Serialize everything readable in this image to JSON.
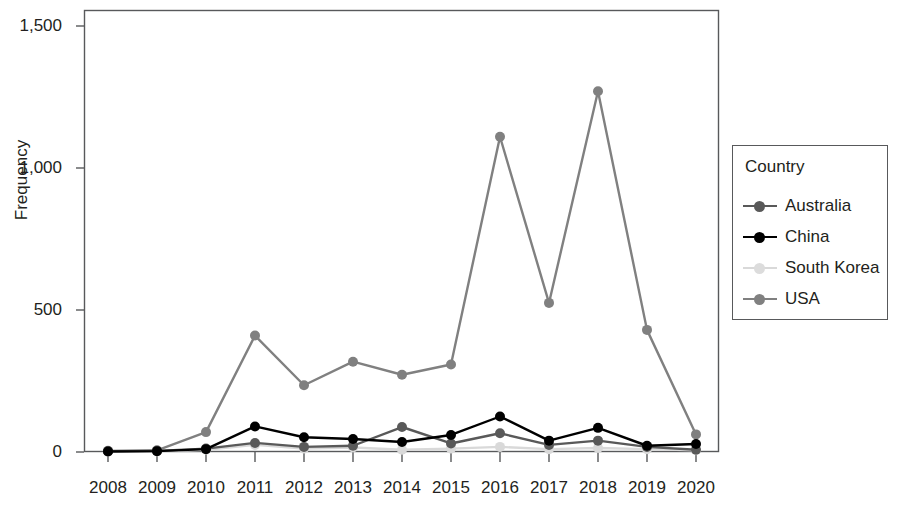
{
  "chart_data": {
    "type": "line",
    "title": "",
    "xlabel": "",
    "ylabel": "Frequency",
    "legend_title": "Country",
    "legend_position": "right",
    "grid": false,
    "x": [
      2008,
      2009,
      2010,
      2011,
      2012,
      2013,
      2014,
      2015,
      2016,
      2017,
      2018,
      2019,
      2020
    ],
    "categories": [
      "2008",
      "2009",
      "2010",
      "2011",
      "2012",
      "2013",
      "2014",
      "2015",
      "2016",
      "2017",
      "2018",
      "2019",
      "2020"
    ],
    "xlim": [
      2008,
      2020
    ],
    "ylim": [
      0,
      1500
    ],
    "ytick_labels": [
      "0",
      "500",
      "1,000",
      "1,500"
    ],
    "ytick_values": [
      0,
      500,
      1000,
      1500
    ],
    "series": [
      {
        "name": "Australia",
        "color": "#595959",
        "values": [
          3,
          4,
          12,
          32,
          18,
          22,
          88,
          30,
          66,
          25,
          40,
          18,
          8
        ]
      },
      {
        "name": "China",
        "color": "#000000",
        "values": [
          2,
          3,
          10,
          90,
          52,
          46,
          35,
          60,
          125,
          40,
          85,
          22,
          28
        ]
      },
      {
        "name": "South Korea",
        "color": "#d9d9d9",
        "values": [
          1,
          2,
          8,
          25,
          12,
          16,
          8,
          12,
          18,
          10,
          14,
          10,
          6
        ]
      },
      {
        "name": "USA",
        "color": "#808080",
        "values": [
          4,
          6,
          70,
          410,
          235,
          318,
          272,
          308,
          1110,
          525,
          1270,
          430,
          62
        ]
      }
    ]
  },
  "legend": {
    "title": "Country",
    "entries": [
      {
        "label": "Australia",
        "color": "#595959"
      },
      {
        "label": "China",
        "color": "#000000"
      },
      {
        "label": "South Korea",
        "color": "#d9d9d9"
      },
      {
        "label": "USA",
        "color": "#808080"
      }
    ]
  },
  "axes": {
    "y_title": "Frequency",
    "y_ticks": [
      "1,500",
      "1,000",
      "500",
      "0"
    ],
    "x_ticks": [
      "2008",
      "2009",
      "2010",
      "2011",
      "2012",
      "2013",
      "2014",
      "2015",
      "2016",
      "2017",
      "2018",
      "2019",
      "2020"
    ]
  },
  "colors": {
    "axis": "#58595b",
    "text": "#231f20",
    "background": "#ffffff"
  }
}
